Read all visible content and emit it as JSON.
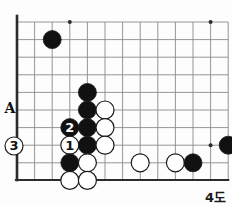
{
  "figure": {
    "caption": "4도",
    "kind": "go-board-diagram",
    "colors": {
      "grid": "#8a8a8a",
      "edge": "#2b2b2b",
      "black_stone": "#111111",
      "white_stone": "#ffffff",
      "stone_outline": "#1a1a1a",
      "background": "#fdfdfd",
      "label_text": "#111111"
    },
    "board": {
      "origin_x": 17,
      "origin_y": 22,
      "spacing": 17.6,
      "cols": 12,
      "rows": 9,
      "stone_radius": 9.0,
      "edge_left_x": 17,
      "edge_bottom_y": 180,
      "left_edge_thick": true,
      "bottom_edge_thick": true
    },
    "star_points": [
      {
        "col": 3,
        "row": 0
      },
      {
        "col": 11,
        "row": 0
      },
      {
        "col": 11,
        "row": 7
      }
    ],
    "stones": [
      {
        "col": 2,
        "row": 1,
        "color": "black",
        "label": "",
        "label_color": ""
      },
      {
        "col": 4,
        "row": 4,
        "color": "black",
        "label": "",
        "label_color": ""
      },
      {
        "col": 4,
        "row": 5,
        "color": "black",
        "label": "",
        "label_color": ""
      },
      {
        "col": 5,
        "row": 5,
        "color": "white",
        "label": "",
        "label_color": ""
      },
      {
        "col": 3,
        "row": 6,
        "color": "black",
        "label": "2",
        "label_color": "white"
      },
      {
        "col": 4,
        "row": 6,
        "color": "black",
        "label": "",
        "label_color": ""
      },
      {
        "col": 5,
        "row": 6,
        "color": "white",
        "label": "",
        "label_color": ""
      },
      {
        "col": 3,
        "row": 7,
        "color": "white",
        "label": "1",
        "label_color": "black"
      },
      {
        "col": 4,
        "row": 7,
        "color": "black",
        "label": "",
        "label_color": ""
      },
      {
        "col": 5,
        "row": 7,
        "color": "white",
        "label": "",
        "label_color": ""
      },
      {
        "col": 3,
        "row": 8,
        "color": "black",
        "label": "",
        "label_color": ""
      },
      {
        "col": 4,
        "row": 8,
        "color": "white",
        "label": "",
        "label_color": ""
      },
      {
        "col": 7,
        "row": 8,
        "color": "white",
        "label": "",
        "label_color": ""
      },
      {
        "col": 9,
        "row": 8,
        "color": "white",
        "label": "",
        "label_color": ""
      },
      {
        "col": 10,
        "row": 8,
        "color": "black",
        "label": "",
        "label_color": ""
      },
      {
        "col": 12,
        "row": 7,
        "color": "black",
        "label": "",
        "label_color": ""
      },
      {
        "col": 3,
        "row": 9,
        "color": "white",
        "label": "",
        "label_color": ""
      },
      {
        "col": 4,
        "row": 9,
        "color": "white",
        "label": "",
        "label_color": ""
      }
    ],
    "off_board_stones": [
      {
        "x": 14,
        "y": 146,
        "color": "white",
        "label": "3",
        "label_color": "black"
      }
    ],
    "point_labels": [
      {
        "text": "A",
        "x": 10,
        "y": 113
      }
    ]
  }
}
